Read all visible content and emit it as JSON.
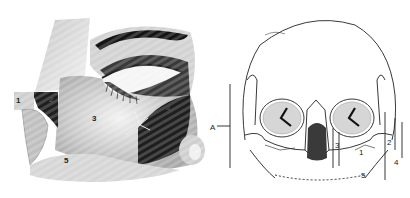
{
  "left_figure": {
    "description": "Oblique view of closed eye region with shaded zones",
    "labels": [
      {
        "id": "1",
        "text": "1",
        "x": 95,
        "y": 121
      },
      {
        "id": "2",
        "text": "2",
        "x": 53,
        "y": 102
      },
      {
        "id": "3",
        "text": "3",
        "x": 168,
        "y": 111
      },
      {
        "id": "4",
        "text": "4",
        "x": 19,
        "y": 102
      },
      {
        "id": "5",
        "text": "5",
        "x": 66,
        "y": 163
      }
    ],
    "colors": {
      "dark_zone": "#1e1e1e",
      "skin_mid": "#bdbdbd",
      "skin_light": "#e6e6e6"
    }
  },
  "right_figure": {
    "description": "Frontal view of skull with measurement brackets",
    "labels": [
      {
        "id": "A",
        "text": "A",
        "x": 212,
        "y": 130
      },
      {
        "id": "1",
        "text": "1",
        "x": 360,
        "y": 153
      },
      {
        "id": "2",
        "text": "2",
        "x": 387,
        "y": 142
      },
      {
        "id": "3",
        "text": "3",
        "x": 336,
        "y": 146
      },
      {
        "id": "4",
        "text": "4",
        "x": 395,
        "y": 162
      },
      {
        "id": "5",
        "text": "5",
        "x": 362,
        "y": 176
      }
    ],
    "colors": {
      "line": "#222222",
      "background": "#ffffff"
    }
  }
}
